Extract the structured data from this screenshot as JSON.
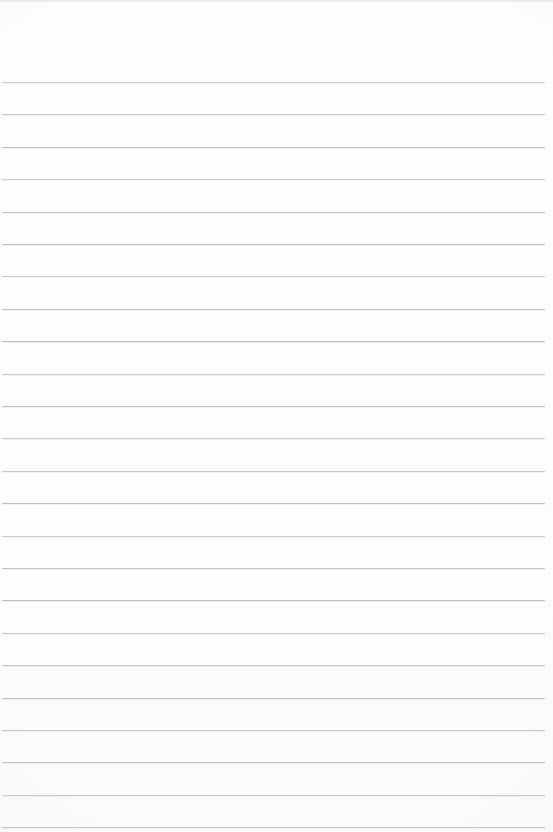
{
  "document": {
    "type": "ruled-paper-scan",
    "title": "Blank Ruled Notebook Paper",
    "content_text": "",
    "has_writing": false,
    "page_width_px": 553,
    "page_height_px": 832
  },
  "paper": {
    "background_color": "#fdfdfd",
    "edge_tone_color": "#f4f4f6",
    "top_margin_px": 82,
    "left_inset_px": 2,
    "right_inset_px": 8
  },
  "ruling": {
    "line_color": "#b9bcc2",
    "line_thickness_px": 1,
    "line_spacing_px": 32.4,
    "first_line_y_px": 82,
    "line_count": 24,
    "line_start_x_px": 2,
    "line_end_x_px": 545,
    "lines_y": [
      82,
      114.4,
      146.8,
      179.2,
      211.6,
      244,
      276.4,
      308.8,
      341.2,
      373.6,
      406,
      438.4,
      470.8,
      503.2,
      535.6,
      568,
      600.4,
      632.8,
      665.2,
      697.6,
      730,
      762.4,
      794.8,
      827.2
    ]
  },
  "header": {
    "label": "",
    "visible": false
  }
}
